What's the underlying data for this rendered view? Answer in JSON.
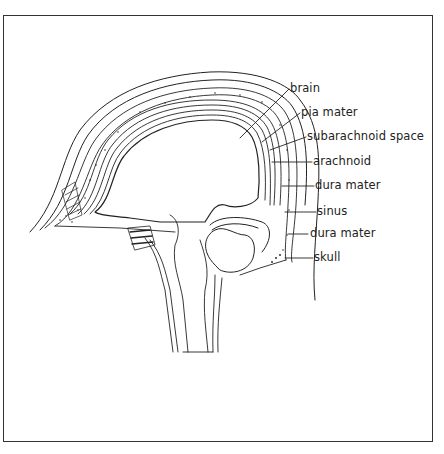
{
  "figure": {
    "labels": [
      {
        "id": "brain",
        "text": "brain"
      },
      {
        "id": "pia_mater",
        "text": "pia mater"
      },
      {
        "id": "subarachnoid_space",
        "text": "subarachnoid space"
      },
      {
        "id": "arachnoid",
        "text": "arachnoid"
      },
      {
        "id": "dura_mater_1",
        "text": "dura mater"
      },
      {
        "id": "sinus",
        "text": "sinus"
      },
      {
        "id": "dura_mater_2",
        "text": "dura mater"
      },
      {
        "id": "skull",
        "text": "skull"
      }
    ]
  },
  "colors": {
    "ink": "#222222",
    "frame": "#333333",
    "background": "#ffffff"
  }
}
